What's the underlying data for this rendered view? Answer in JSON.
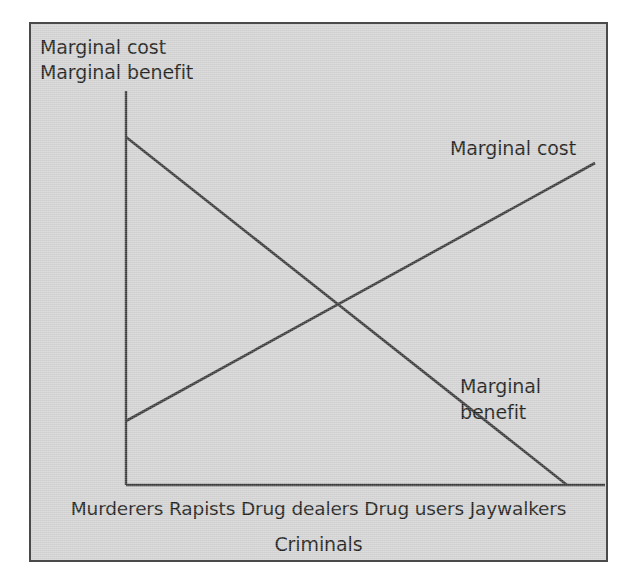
{
  "figure": {
    "background_color": "#d3d3d3",
    "border_color": "#4a4a4a",
    "line_color": "#3a3a3a",
    "text_color": "#1c1c1c"
  },
  "labels": {
    "y_axis_title_line1": "Marginal cost",
    "y_axis_title_line2": "Marginal benefit",
    "x_axis_title": "Criminals",
    "series_cost": "Marginal cost",
    "series_benefit_line1": "Marginal",
    "series_benefit_line2": "benefit",
    "tick_row": "Murderers Rapists Drug dealers Drug users Jaywalkers"
  },
  "chart_data": {
    "type": "line",
    "title": "",
    "subtitle": "",
    "xlabel": "Criminals",
    "ylabel": "Marginal cost\nMarginal benefit",
    "categories": [
      "Murderers",
      "Rapists",
      "Drug dealers",
      "Drug users",
      "Jaywalkers"
    ],
    "x": [
      1,
      2,
      3,
      4,
      5
    ],
    "xlim": [
      0.5,
      5.5
    ],
    "ylim": [
      0,
      100
    ],
    "grid": false,
    "legend": "none",
    "axis_ticks_shown": false,
    "annotations": [
      {
        "text": "Marginal cost",
        "series": "Marginal cost",
        "position": "upper-right"
      },
      {
        "text": "Marginal benefit",
        "series": "Marginal benefit",
        "position": "lower-right"
      }
    ],
    "series": [
      {
        "name": "Marginal cost",
        "description": "Upward sloping straight line: marginal cost of enforcement rises as society moves from serious to petty criminals",
        "values": [
          17,
          33,
          50,
          66,
          82
        ],
        "endpoints": {
          "start": [
            1,
            17
          ],
          "end": [
            5,
            82
          ]
        }
      },
      {
        "name": "Marginal benefit",
        "description": "Downward sloping straight line: marginal benefit of enforcement falls as society moves from serious to petty criminals",
        "values": [
          89,
          70,
          51,
          32,
          13
        ],
        "endpoints": {
          "start": [
            1,
            89
          ],
          "end": [
            5,
            13
          ]
        }
      }
    ],
    "intersection": {
      "x": 3.0,
      "y": 50,
      "note": "Optimal level of law enforcement where marginal cost equals marginal benefit"
    }
  },
  "geometry": {
    "y_axis": {
      "x": 95,
      "y_top": 67,
      "y_bottom": 461
    },
    "x_axis": {
      "y": 461,
      "x_left": 95,
      "x_right": 574
    },
    "cost_line": {
      "x1": 95,
      "y1": 397,
      "x2": 564,
      "y2": 139
    },
    "benefit_line": {
      "x1": 95,
      "y1": 113,
      "x2": 536,
      "y2": 461
    }
  }
}
